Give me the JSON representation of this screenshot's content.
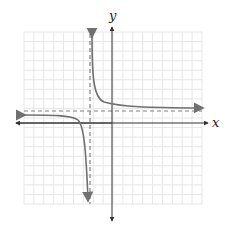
{
  "chart_data": {
    "type": "line",
    "title": "",
    "xlabel": "x",
    "ylabel": "y",
    "grid": true,
    "grid_range": {
      "x": [
        -9,
        9
      ],
      "y": [
        -9,
        9
      ]
    },
    "tick_labels": [],
    "asymptotes": {
      "vertical": {
        "x": -2,
        "style": "dashed"
      },
      "horizontal": {
        "y": 1,
        "style": "dashed"
      }
    },
    "series": [
      {
        "name": "right branch",
        "description": "hyperbola branch in upper-right region, approaching x=-2 upward and y=1 rightward",
        "points": [
          [
            -1.9,
            9
          ],
          [
            -1.5,
            3
          ],
          [
            -1,
            2
          ],
          [
            0,
            1.5
          ],
          [
            2,
            1.25
          ],
          [
            5,
            1.14
          ],
          [
            9,
            1.09
          ]
        ]
      },
      {
        "name": "left branch",
        "description": "hyperbola branch in lower-left region, approaching y=1 leftward and x=-2 downward",
        "points": [
          [
            -9,
            0.85
          ],
          [
            -6,
            0.75
          ],
          [
            -4,
            0.5
          ],
          [
            -3,
            0
          ],
          [
            -2.5,
            -1
          ],
          [
            -2.2,
            -4
          ],
          [
            -2.1,
            -9
          ]
        ]
      }
    ],
    "colors": {
      "curve": "#707070",
      "asymptote": "#808080",
      "axis": "#333333",
      "grid": "#e6e6e6"
    }
  }
}
